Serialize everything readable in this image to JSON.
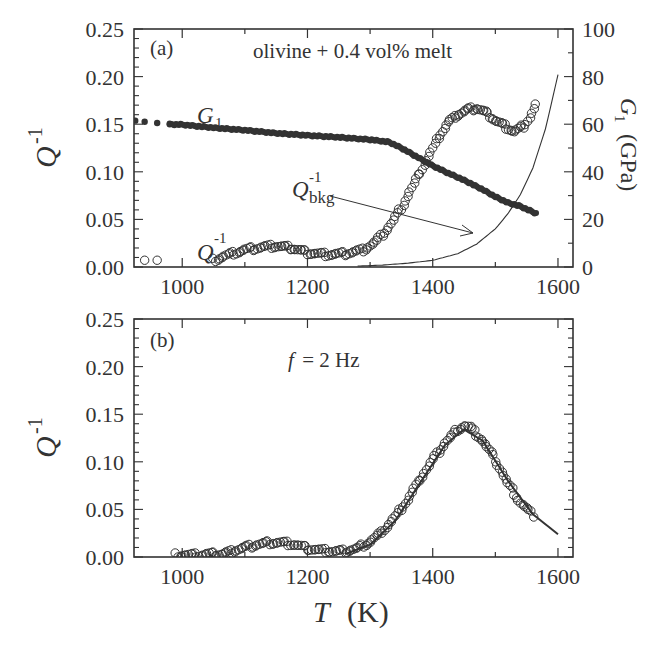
{
  "chart_data": [
    {
      "panel": "a",
      "type": "scatter",
      "panel_label": "(a)",
      "annotation": "olivine + 0.4 vol% melt",
      "xlabel": "T (K)",
      "ylabel": "Q^-1",
      "y2label": "G_1 (GPa)",
      "xlim": [
        923,
        1624
      ],
      "ylim": [
        0,
        0.25
      ],
      "y2lim": [
        0,
        100
      ],
      "xticks": [
        1000,
        1200,
        1400,
        1600
      ],
      "yticks": [
        0.0,
        0.05,
        0.1,
        0.15,
        0.2,
        0.25
      ],
      "y2ticks": [
        0,
        20,
        40,
        60,
        80,
        100
      ],
      "grid": false,
      "series": [
        {
          "name": "Q^-1",
          "marker": "open-circle",
          "axis": "left",
          "x": [
            940,
            960,
            1050,
            1070,
            1100,
            1130,
            1150,
            1175,
            1200,
            1230,
            1260,
            1290,
            1310,
            1330,
            1350,
            1370,
            1390,
            1400,
            1410,
            1425,
            1440,
            1455,
            1470,
            1485,
            1500,
            1515,
            1530,
            1545,
            1555,
            1565
          ],
          "y": [
            0.005,
            0.005,
            0.005,
            0.01,
            0.016,
            0.019,
            0.02,
            0.018,
            0.013,
            0.011,
            0.012,
            0.016,
            0.025,
            0.04,
            0.06,
            0.085,
            0.11,
            0.122,
            0.135,
            0.15,
            0.158,
            0.163,
            0.165,
            0.16,
            0.152,
            0.146,
            0.14,
            0.146,
            0.155,
            0.168
          ]
        },
        {
          "name": "G_1",
          "marker": "filled-circle",
          "axis": "right",
          "x": [
            925,
            940,
            960,
            980,
            1000,
            1050,
            1100,
            1150,
            1200,
            1250,
            1300,
            1330,
            1350,
            1370,
            1390,
            1400,
            1420,
            1450,
            1480,
            1500,
            1520,
            1540,
            1565
          ],
          "y": [
            61.5,
            61.0,
            60.5,
            60.0,
            59.8,
            58.5,
            57.5,
            56.2,
            55.3,
            54.5,
            53.5,
            52.5,
            50.0,
            47.0,
            44.0,
            42.5,
            40.0,
            36.5,
            32.5,
            29.5,
            27.0,
            25.5,
            22.5
          ]
        },
        {
          "name": "Q^-1_bkg",
          "marker": "line",
          "axis": "left",
          "x": [
            1280,
            1320,
            1360,
            1400,
            1440,
            1470,
            1500,
            1520,
            1540,
            1560,
            1580,
            1600
          ],
          "y": [
            0.001,
            0.002,
            0.004,
            0.007,
            0.014,
            0.024,
            0.04,
            0.056,
            0.076,
            0.104,
            0.145,
            0.202
          ]
        }
      ],
      "labels": [
        "G_1",
        "Q^-1",
        "Q^-1_bkg"
      ]
    },
    {
      "panel": "b",
      "type": "scatter",
      "panel_label": "(b)",
      "annotation": "f = 2 Hz",
      "xlabel": "T (K)",
      "ylabel": "Q^-1",
      "xlim": [
        923,
        1624
      ],
      "ylim": [
        0,
        0.25
      ],
      "xticks": [
        1000,
        1200,
        1400,
        1600
      ],
      "yticks": [
        0.0,
        0.05,
        0.1,
        0.15,
        0.2,
        0.25
      ],
      "grid": false,
      "series": [
        {
          "name": "Q^-1 (data)",
          "marker": "open-circle",
          "x": [
            990,
            1000,
            1010,
            1020,
            1030,
            1040,
            1065,
            1080,
            1100,
            1120,
            1140,
            1160,
            1180,
            1200,
            1220,
            1240,
            1260,
            1280,
            1300,
            1320,
            1340,
            1360,
            1380,
            1400,
            1420,
            1440,
            1450,
            1460,
            1480,
            1500,
            1520,
            1540,
            1560
          ],
          "y": [
            0.0,
            0.0,
            0.0,
            0.0,
            0.0,
            0.001,
            0.001,
            0.004,
            0.008,
            0.011,
            0.013,
            0.013,
            0.011,
            0.007,
            0.005,
            0.004,
            0.004,
            0.007,
            0.014,
            0.025,
            0.04,
            0.058,
            0.08,
            0.1,
            0.118,
            0.132,
            0.136,
            0.134,
            0.12,
            0.1,
            0.075,
            0.055,
            0.042
          ]
        },
        {
          "name": "fit",
          "marker": "line",
          "x": [
            1260,
            1300,
            1340,
            1380,
            1420,
            1450,
            1480,
            1520,
            1560,
            1600
          ],
          "y": [
            0.003,
            0.013,
            0.038,
            0.078,
            0.118,
            0.134,
            0.122,
            0.08,
            0.045,
            0.024
          ]
        }
      ]
    }
  ],
  "figure": {
    "xlabel_text": "T",
    "xlabel_unit": "(K)",
    "ylabel_base": "Q",
    "ylabel_sup": "-1",
    "y2label_base": "G",
    "y2label_sub": "1",
    "y2label_unit": "(GPa)",
    "panel_a_label": "(a)",
    "panel_b_label": "(b)",
    "panel_a_note": "olivine + 0.4 vol% melt",
    "panel_b_note_f": "f",
    "panel_b_note_rest": " = 2 Hz",
    "label_G1_base": "G",
    "label_G1_sub": "1",
    "label_Q_base": "Q",
    "label_Q_sup": "-1",
    "label_Qbkg_base": "Q",
    "label_Qbkg_sup": "-1",
    "label_Qbkg_sub": "bkg",
    "xtick_labels": [
      "1000",
      "1200",
      "1400",
      "1600"
    ],
    "ytick_labels": [
      "0.00",
      "0.05",
      "0.10",
      "0.15",
      "0.20",
      "0.25"
    ],
    "y2tick_labels": [
      "0",
      "20",
      "40",
      "60",
      "80",
      "100"
    ],
    "colors": {
      "ink": "#333333",
      "background": "#ffffff"
    }
  }
}
